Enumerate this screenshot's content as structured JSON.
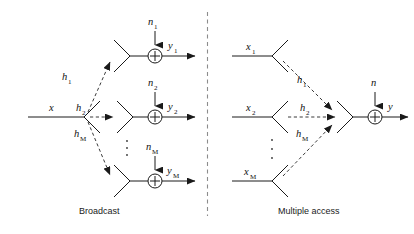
{
  "figure": {
    "width": 414,
    "height": 234,
    "background": "#ffffff",
    "line_color": "#1a1a1a",
    "dash_color": "#3a3a3a",
    "divider_color": "#8c8c8c"
  },
  "panels": [
    {
      "id": "broadcast",
      "caption": "Broadcast",
      "transmit": {
        "label": "x",
        "sub": ""
      },
      "channels": [
        {
          "label": "h",
          "sub": "1"
        },
        {
          "label": "h",
          "sub": "2"
        },
        {
          "label": "h",
          "sub": "M"
        }
      ],
      "noises": [
        {
          "label": "n",
          "sub": "1"
        },
        {
          "label": "n",
          "sub": "2"
        },
        {
          "label": "n",
          "sub": "M"
        }
      ],
      "outputs": [
        {
          "label": "y",
          "sub": "1"
        },
        {
          "label": "y",
          "sub": "2"
        },
        {
          "label": "y",
          "sub": "M"
        }
      ],
      "ellipsis": "vertical-dots",
      "adder_glyph": "plus-in-circle"
    },
    {
      "id": "multiple-access",
      "caption": "Multiple access",
      "transmits": [
        {
          "label": "x",
          "sub": "1"
        },
        {
          "label": "x",
          "sub": "2"
        },
        {
          "label": "x",
          "sub": "M"
        }
      ],
      "channels": [
        {
          "label": "h",
          "sub": "1"
        },
        {
          "label": "h",
          "sub": "2"
        },
        {
          "label": "h",
          "sub": "M"
        }
      ],
      "noise": {
        "label": "n",
        "sub": ""
      },
      "output": {
        "label": "y",
        "sub": ""
      },
      "ellipsis": "vertical-dots",
      "adder_glyph": "plus-in-circle"
    }
  ]
}
